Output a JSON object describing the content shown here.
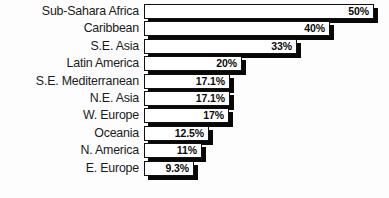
{
  "chart_data": {
    "type": "bar",
    "orientation": "horizontal",
    "title": "",
    "subtitle": "",
    "xlabel": "",
    "ylabel": "",
    "grid": false,
    "legend": null,
    "axis_visible": false,
    "xlim": [
      0,
      50
    ],
    "categories": [
      "Sub-Sahara Africa",
      "Caribbean",
      "S.E. Asia",
      "Latin America",
      "S.E. Mediterranean",
      "N.E. Asia",
      "W. Europe",
      "Oceania",
      "N. America",
      "E. Europe"
    ],
    "values": [
      50,
      40,
      33,
      20,
      17.1,
      17.1,
      17,
      12.5,
      11,
      9.3
    ],
    "value_labels": [
      "50%",
      "40%",
      "33%",
      "20%",
      "17.1%",
      "17.1%",
      "17%",
      "12.5%",
      "11%",
      "9.3%"
    ],
    "bar_pixel_widths": [
      230,
      186,
      153,
      98,
      86,
      86,
      85,
      65,
      58,
      50
    ],
    "colors": {
      "bar_fill": "#ffffff",
      "bar_outline": "#101010",
      "bar_shadow": "#080808",
      "label_text": "#1b1b1b",
      "value_text": "#0a0a0a",
      "background": "#fdfdfd"
    }
  }
}
